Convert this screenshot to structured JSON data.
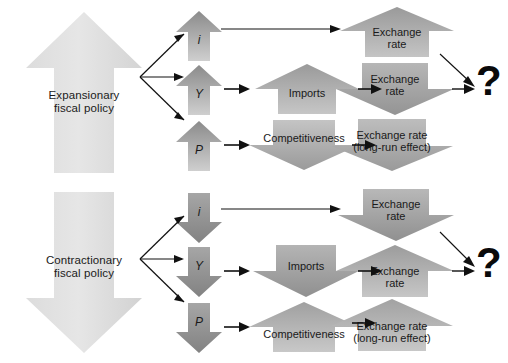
{
  "figure": {
    "type": "flow-diagram",
    "background": "#ffffff",
    "width": 508,
    "height": 363,
    "colors": {
      "policy_arrow_light": "#e3e3e3",
      "policy_arrow_mid": "#d9d9d9",
      "node_dark": "#8d8d8d",
      "node_light": "#c9c9c9",
      "node_mid": "#a8a8a8",
      "line": "#111111",
      "text": "#1a1a1a",
      "question_mark": "#0a0a0a"
    }
  },
  "panels": [
    {
      "id": "expansionary",
      "policy": {
        "label": "Expansionary\nfiscal policy",
        "line1": "Expansionary",
        "line2": "fiscal policy",
        "direction": "up"
      },
      "variables": [
        {
          "label": "i",
          "direction": "up"
        },
        {
          "label": "Y",
          "direction": "up"
        },
        {
          "label": "P",
          "direction": "up"
        }
      ],
      "middle": [
        {
          "label": "",
          "direction": "none",
          "present": false
        },
        {
          "label": "Imports",
          "direction": "up"
        },
        {
          "label": "Competitiveness",
          "direction": "down"
        }
      ],
      "outcomes": [
        {
          "line1": "Exchange",
          "line2": "rate",
          "direction": "up"
        },
        {
          "line1": "Exchange",
          "line2": "rate",
          "direction": "down"
        },
        {
          "line1": "Exchange rate",
          "line2": "(long-run effect)",
          "direction": "down"
        }
      ],
      "question": "?"
    },
    {
      "id": "contractionary",
      "policy": {
        "label": "Contractionary\nfiscal policy",
        "line1": "Contractionary",
        "line2": "fiscal policy",
        "direction": "down"
      },
      "variables": [
        {
          "label": "i",
          "direction": "down"
        },
        {
          "label": "Y",
          "direction": "down"
        },
        {
          "label": "P",
          "direction": "down"
        }
      ],
      "middle": [
        {
          "label": "",
          "direction": "none",
          "present": false
        },
        {
          "label": "Imports",
          "direction": "down"
        },
        {
          "label": "Competitiveness",
          "direction": "up"
        }
      ],
      "outcomes": [
        {
          "line1": "Exchange",
          "line2": "rate",
          "direction": "down"
        },
        {
          "line1": "Exchange",
          "line2": "rate",
          "direction": "up"
        },
        {
          "line1": "Exchange rate",
          "line2": "(long-run effect)",
          "direction": "up"
        }
      ],
      "question": "?"
    }
  ]
}
